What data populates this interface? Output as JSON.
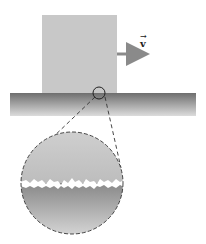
{
  "diagram": {
    "block": {
      "x": 42,
      "y": 15,
      "width": 75,
      "height": 78,
      "color": "#c8c8c8"
    },
    "velocity_arrow": {
      "label": "v",
      "x1": 117,
      "y1": 54,
      "x2": 147,
      "y2": 54,
      "color": "#8a8a8a"
    },
    "ground": {
      "x": 10,
      "y": 93,
      "width": 186,
      "height": 23,
      "color_top": "#7a7a7a",
      "color_bottom": "#d8d8d8"
    },
    "zoom_marker": {
      "cx": 99,
      "cy": 93,
      "r": 6
    },
    "magnified_view": {
      "cx": 72,
      "cy": 183,
      "r": 51,
      "upper_color": "#c6c6c6",
      "lower_color_top": "#8c8c8c",
      "lower_color_bottom": "#d4d4d4",
      "interface_y": 183
    }
  },
  "labels": {
    "velocity": "v"
  }
}
